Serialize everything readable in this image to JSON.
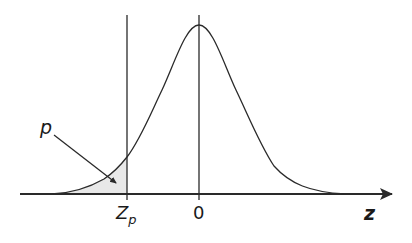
{
  "diagram": {
    "type": "standard normal distribution curve",
    "labels": {
      "p": "p",
      "zp_main": "Z",
      "zp_sub": "p",
      "zero": "0",
      "axis": "z"
    },
    "colors": {
      "line": "#2a2a2a",
      "shade": "#e6e6e6"
    }
  }
}
